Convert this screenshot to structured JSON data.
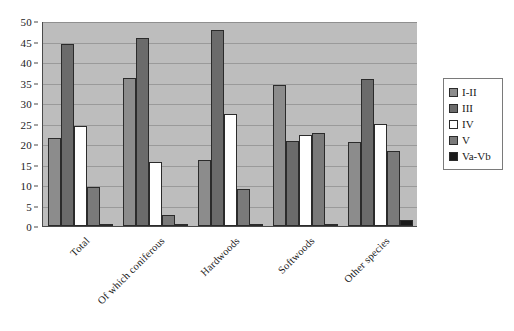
{
  "chart_data": {
    "type": "bar",
    "title": "",
    "subtitle": "",
    "xlabel": "",
    "ylabel": "",
    "ylim": [
      0,
      50
    ],
    "ytick_step": 5,
    "yticks": [
      0,
      5,
      10,
      15,
      20,
      25,
      30,
      35,
      40,
      45,
      50
    ],
    "grid": true,
    "grid_axis": "y",
    "legend_position": "right",
    "orientation": "vertical",
    "grouped": true,
    "xtick_rotation": -45,
    "categories": [
      "Total",
      "Of which coniferous",
      "Hardwoods",
      "Softwoods",
      "Other species"
    ],
    "series": [
      {
        "name": "I-II",
        "color": "#8c8c8c",
        "values": [
          21.5,
          36.0,
          16.2,
          34.5,
          20.6
        ]
      },
      {
        "name": "III",
        "color": "#6b6b6b",
        "values": [
          44.5,
          45.8,
          47.7,
          20.8,
          35.8
        ]
      },
      {
        "name": "IV",
        "color": "#ffffff",
        "values": [
          24.5,
          15.5,
          27.4,
          22.3,
          24.9
        ]
      },
      {
        "name": "V",
        "color": "#7a7a7a",
        "values": [
          9.4,
          2.6,
          9.0,
          22.8,
          18.3
        ]
      },
      {
        "name": "Va-Vb",
        "color": "#1a1a1a",
        "values": [
          0.2,
          0.2,
          0.3,
          0.2,
          1.5
        ]
      }
    ],
    "plot_background": "#bdbdbd",
    "page_background": "#ffffff",
    "axis_color": "#4a4a4a",
    "gridline_color": "#9a9a9a",
    "bar_border_color": "#2b2b2b"
  }
}
